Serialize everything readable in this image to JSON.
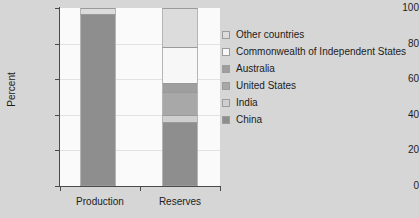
{
  "chart_data": {
    "type": "bar",
    "title": "",
    "xlabel": "",
    "ylabel": "Percent",
    "ylim": [
      0,
      100
    ],
    "yticks": [
      0,
      20,
      40,
      60,
      80,
      100
    ],
    "grid": true,
    "stacked": true,
    "legend_position": "right",
    "categories": [
      "Production",
      "Reserves"
    ],
    "series": [
      {
        "name": "China",
        "color": "#8e8e8e",
        "values": [
          96.5,
          36.0
        ]
      },
      {
        "name": "India",
        "color": "#cfcfcf",
        "values": [
          0.0,
          4.0
        ]
      },
      {
        "name": "United States",
        "color": "#a8a8a8",
        "values": [
          0.0,
          13.0
        ]
      },
      {
        "name": "Australia",
        "color": "#9e9e9e",
        "values": [
          0.0,
          5.0
        ]
      },
      {
        "name": "Commonwealth of Independent States",
        "color": "#f7f7f7",
        "values": [
          0.0,
          20.0
        ]
      },
      {
        "name": "Other countries",
        "color": "#dcdcdc",
        "values": [
          3.5,
          22.0
        ]
      }
    ]
  },
  "axis": {
    "y_title": "Percent",
    "y_tick_labels": [
      "0",
      "20",
      "40",
      "60",
      "80",
      "100"
    ],
    "x_tick_labels": [
      "Production",
      "Reserves"
    ]
  },
  "legend": {
    "items": [
      {
        "label": "Other countries",
        "color": "#dcdcdc"
      },
      {
        "label": "Commonwealth of Independent States",
        "color": "#f7f7f7"
      },
      {
        "label": "Australia",
        "color": "#9e9e9e"
      },
      {
        "label": "United States",
        "color": "#a8a8a8"
      },
      {
        "label": "India",
        "color": "#cfcfcf"
      },
      {
        "label": "China",
        "color": "#8e8e8e"
      }
    ]
  }
}
